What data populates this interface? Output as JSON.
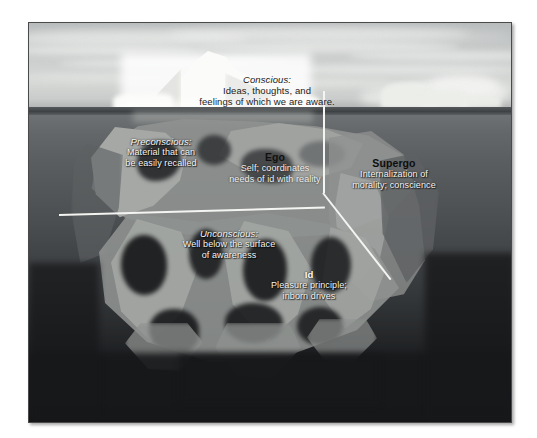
{
  "figure": {
    "frame": {
      "border_color": "#4a4a4a",
      "background": "#ffffff"
    }
  },
  "scene": {
    "sky_color": "#c9cccb",
    "water_color": "#4c4f51",
    "iceberg_tip_color": "#fbfbf9",
    "submerged_color": "#8e918f",
    "line_color": "#f4f5f2"
  },
  "labels": {
    "conscious": {
      "title": "Conscious:",
      "line1": "Ideas, thoughts, and",
      "line2": "feelings of which we are aware."
    },
    "preconscious": {
      "title": "Preconscious:",
      "line1": "Material that can",
      "line2": "be easily recalled"
    },
    "unconscious": {
      "title": "Unconscious:",
      "line1": "Well below the surface",
      "line2": "of awareness"
    },
    "ego": {
      "title": "Ego",
      "line1": "Self; coordinates",
      "line2": "needs of id with reality"
    },
    "superego": {
      "title": "Supergo",
      "line1": "Internalization of",
      "line2": "morality; conscience"
    },
    "id": {
      "title": "Id",
      "line1": "Pleasure principle;",
      "line2": "inborn drives"
    }
  }
}
